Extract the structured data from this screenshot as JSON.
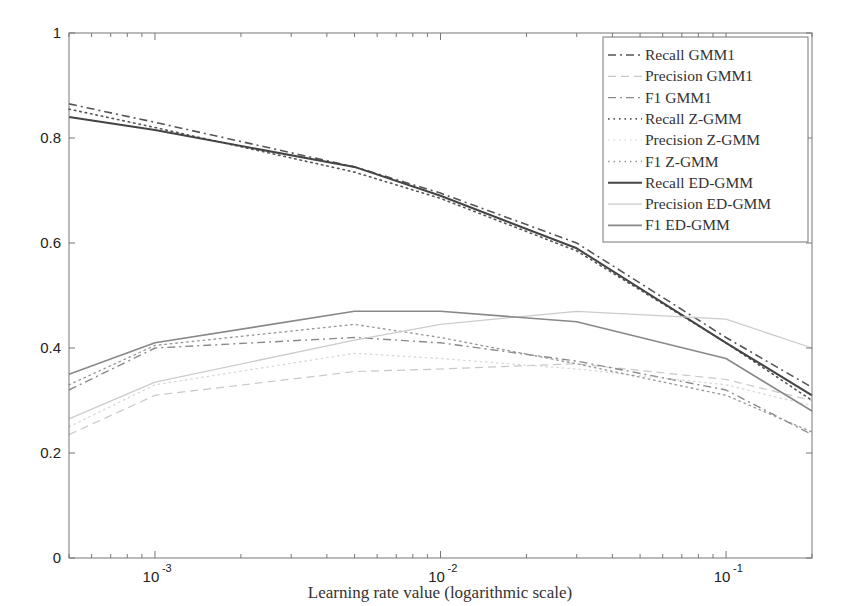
{
  "chart_data": {
    "type": "line",
    "title": "",
    "xlabel": "Learning rate value (logarithmic scale)",
    "ylabel": "",
    "xscale": "log",
    "xlim": [
      0.0005,
      0.2
    ],
    "ylim": [
      0,
      1
    ],
    "grid": false,
    "legend_position": "upper right",
    "x_ticks": [
      {
        "value": 0.001,
        "base": "10",
        "exp": "-3"
      },
      {
        "value": 0.01,
        "base": "10",
        "exp": "-2"
      },
      {
        "value": 0.1,
        "base": "10",
        "exp": "-1"
      }
    ],
    "y_ticks": [
      "0",
      "0.2",
      "0.4",
      "0.6",
      "0.8",
      "1"
    ],
    "x": [
      0.0005,
      0.001,
      0.005,
      0.01,
      0.03,
      0.1,
      0.2
    ],
    "series": [
      {
        "name": "Recall GMM1",
        "style": "dashdot",
        "color": "#555555",
        "width": 1.6,
        "values": [
          0.865,
          0.83,
          0.745,
          0.695,
          0.6,
          0.42,
          0.325
        ]
      },
      {
        "name": "Precision GMM1",
        "style": "dashed",
        "color": "#c8c8c8",
        "width": 1.2,
        "values": [
          0.235,
          0.31,
          0.355,
          0.36,
          0.37,
          0.34,
          0.3
        ]
      },
      {
        "name": "F1 GMM1",
        "style": "dashdot",
        "color": "#8a8a8a",
        "width": 1.4,
        "values": [
          0.32,
          0.4,
          0.42,
          0.41,
          0.375,
          0.32,
          0.235
        ]
      },
      {
        "name": "Recall Z-GMM",
        "style": "dotted",
        "color": "#555555",
        "width": 1.6,
        "values": [
          0.855,
          0.82,
          0.735,
          0.685,
          0.585,
          0.41,
          0.3
        ]
      },
      {
        "name": "Precision Z-GMM",
        "style": "dotted",
        "color": "#d8d8d8",
        "width": 1.3,
        "values": [
          0.25,
          0.33,
          0.39,
          0.38,
          0.36,
          0.33,
          0.29
        ]
      },
      {
        "name": "F1 Z-GMM",
        "style": "dotted",
        "color": "#999999",
        "width": 1.4,
        "values": [
          0.33,
          0.405,
          0.445,
          0.42,
          0.37,
          0.31,
          0.24
        ]
      },
      {
        "name": "Recall  ED-GMM",
        "style": "solid",
        "color": "#444444",
        "width": 2.0,
        "values": [
          0.84,
          0.815,
          0.745,
          0.69,
          0.59,
          0.41,
          0.31
        ]
      },
      {
        "name": "Precision ED-GMM",
        "style": "solid",
        "color": "#cccccc",
        "width": 1.3,
        "values": [
          0.265,
          0.335,
          0.415,
          0.445,
          0.47,
          0.455,
          0.4
        ]
      },
      {
        "name": "F1 ED-GMM",
        "style": "solid",
        "color": "#888888",
        "width": 1.6,
        "values": [
          0.35,
          0.41,
          0.47,
          0.47,
          0.45,
          0.38,
          0.28
        ]
      }
    ]
  }
}
